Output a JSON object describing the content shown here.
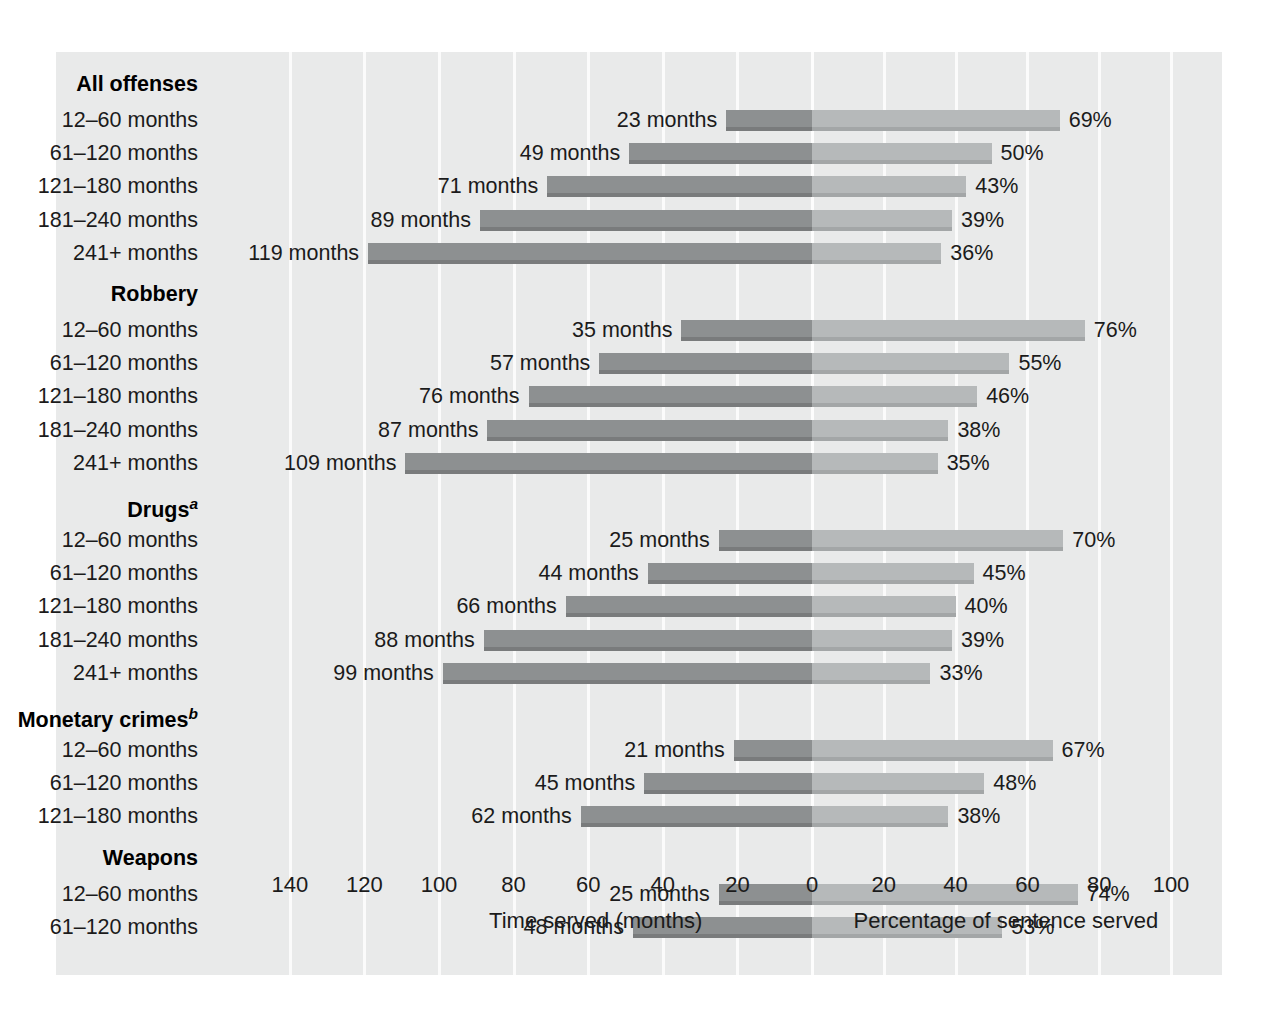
{
  "chart_data": {
    "type": "bar",
    "subtype": "bidirectional-paired-bar",
    "title": "",
    "left_axis": {
      "label": "Time served (months)",
      "ticks": [
        140,
        120,
        100,
        80,
        60,
        40,
        20,
        0
      ],
      "min": 0,
      "max": 145,
      "direction": "right-to-left"
    },
    "right_axis": {
      "label": "Percentage of sentence served",
      "ticks": [
        0,
        20,
        40,
        60,
        80,
        100
      ],
      "min": 0,
      "max": 100,
      "direction": "left-to-right"
    },
    "grid": true,
    "legend": null,
    "series": [
      {
        "name": "Time served (months)",
        "side": "left",
        "color": "#8d9091"
      },
      {
        "name": "Percentage of sentence served",
        "side": "right",
        "color": "#b6b9ba"
      }
    ],
    "groups": [
      {
        "name": "All offenses",
        "footnote": "",
        "rows": [
          {
            "category": "12–60 months",
            "months": 23,
            "months_label": "23 months",
            "percent": 69,
            "percent_label": "69%"
          },
          {
            "category": "61–120 months",
            "months": 49,
            "months_label": "49 months",
            "percent": 50,
            "percent_label": "50%"
          },
          {
            "category": "121–180 months",
            "months": 71,
            "months_label": "71 months",
            "percent": 43,
            "percent_label": "43%"
          },
          {
            "category": "181–240 months",
            "months": 89,
            "months_label": "89 months",
            "percent": 39,
            "percent_label": "39%"
          },
          {
            "category": "241+ months",
            "months": 119,
            "months_label": "119 months",
            "percent": 36,
            "percent_label": "36%"
          }
        ]
      },
      {
        "name": "Robbery",
        "footnote": "",
        "rows": [
          {
            "category": "12–60 months",
            "months": 35,
            "months_label": "35 months",
            "percent": 76,
            "percent_label": "76%"
          },
          {
            "category": "61–120 months",
            "months": 57,
            "months_label": "57 months",
            "percent": 55,
            "percent_label": "55%"
          },
          {
            "category": "121–180 months",
            "months": 76,
            "months_label": "76 months",
            "percent": 46,
            "percent_label": "46%"
          },
          {
            "category": "181–240 months",
            "months": 87,
            "months_label": "87 months",
            "percent": 38,
            "percent_label": "38%"
          },
          {
            "category": "241+ months",
            "months": 109,
            "months_label": "109 months",
            "percent": 35,
            "percent_label": "35%"
          }
        ]
      },
      {
        "name": "Drugs",
        "footnote": "a",
        "rows": [
          {
            "category": "12–60 months",
            "months": 25,
            "months_label": "25 months",
            "percent": 70,
            "percent_label": "70%"
          },
          {
            "category": "61–120 months",
            "months": 44,
            "months_label": "44 months",
            "percent": 45,
            "percent_label": "45%"
          },
          {
            "category": "121–180 months",
            "months": 66,
            "months_label": "66 months",
            "percent": 40,
            "percent_label": "40%"
          },
          {
            "category": "181–240 months",
            "months": 88,
            "months_label": "88 months",
            "percent": 39,
            "percent_label": "39%"
          },
          {
            "category": "241+ months",
            "months": 99,
            "months_label": "99 months",
            "percent": 33,
            "percent_label": "33%"
          }
        ]
      },
      {
        "name": "Monetary crimes",
        "footnote": "b",
        "rows": [
          {
            "category": "12–60 months",
            "months": 21,
            "months_label": "21 months",
            "percent": 67,
            "percent_label": "67%"
          },
          {
            "category": "61–120 months",
            "months": 45,
            "months_label": "45 months",
            "percent": 48,
            "percent_label": "48%"
          },
          {
            "category": "121–180 months",
            "months": 62,
            "months_label": "62 months",
            "percent": 38,
            "percent_label": "38%"
          }
        ]
      },
      {
        "name": "Weapons",
        "footnote": "",
        "rows": [
          {
            "category": "12–60 months",
            "months": 25,
            "months_label": "25 months",
            "percent": 74,
            "percent_label": "74%"
          },
          {
            "category": "61–120 months",
            "months": 48,
            "months_label": "48 months",
            "percent": 53,
            "percent_label": "53%"
          }
        ]
      }
    ]
  },
  "colors": {
    "page_background": "#ffffff",
    "panel_background": "#e9eaea",
    "gridline": "#fbfbfb",
    "bar_left": "#8d9091",
    "bar_right": "#b6b9ba",
    "text": "#1b1b1b"
  }
}
